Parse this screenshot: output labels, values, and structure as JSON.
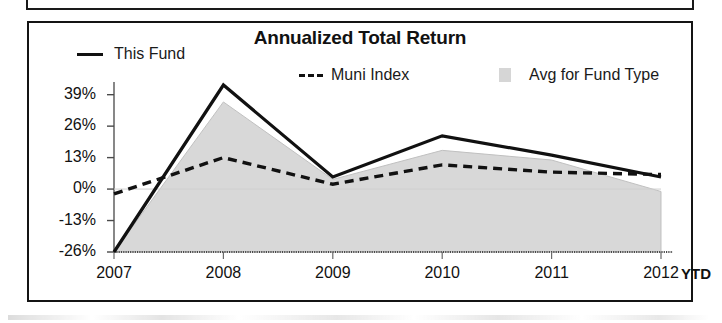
{
  "panel": {
    "title": "Annualized Total Return"
  },
  "legend": {
    "items": [
      {
        "label": "This Fund",
        "marker": "solid-line-swatch",
        "color": "#111111"
      },
      {
        "label": "Muni Index",
        "marker": "dashed-line-swatch",
        "color": "#111111"
      },
      {
        "label": "Avg for Fund Type",
        "marker": "area-fill-swatch",
        "color": "#d6d6d6"
      }
    ]
  },
  "axes": {
    "y_ticks": [
      "39%",
      "26%",
      "13%",
      "0%",
      "-13%",
      "-26%"
    ],
    "x_ticks": [
      "2007",
      "2008",
      "2009",
      "2010",
      "2011",
      "2012"
    ],
    "x_suffix": "YTD"
  },
  "chart_data": {
    "type": "line",
    "title": "Annualized Total Return",
    "xlabel": "",
    "ylabel": "",
    "categories": [
      "2007",
      "2008",
      "2009",
      "2010",
      "2011",
      "2012"
    ],
    "x_suffix_label": "YTD",
    "ylim": [
      -26,
      43
    ],
    "ytick_values": [
      39,
      26,
      13,
      0,
      -13,
      -26
    ],
    "ytick_labels": [
      "39%",
      "26%",
      "13%",
      "0%",
      "-13%",
      "-26%"
    ],
    "grid": false,
    "legend_position": "top",
    "series": [
      {
        "name": "This Fund",
        "style": "solid",
        "color": "#111111",
        "values": [
          -26,
          43,
          5,
          22,
          14,
          5
        ]
      },
      {
        "name": "Muni Index",
        "style": "dashed",
        "color": "#111111",
        "values": [
          -2,
          13,
          2,
          10,
          7,
          6
        ]
      },
      {
        "name": "Avg for Fund Type",
        "style": "area",
        "color": "#d6d6d6",
        "values": [
          -26,
          36,
          4,
          16,
          12,
          -1
        ]
      }
    ]
  }
}
